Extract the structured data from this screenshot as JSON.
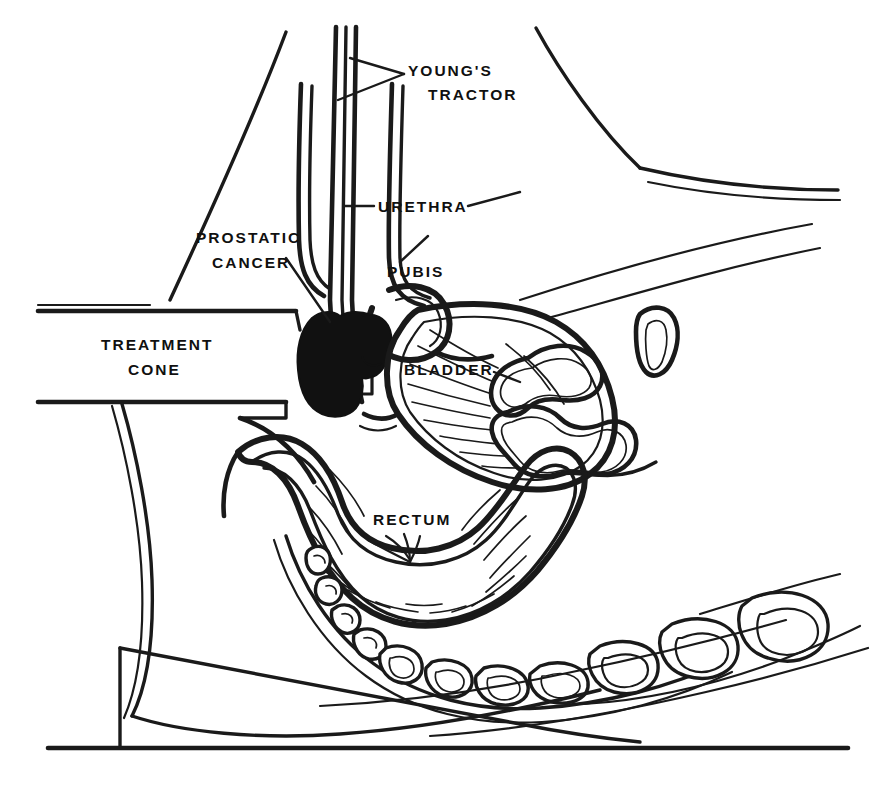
{
  "figure": {
    "kind": "anatomical-line-drawing",
    "orientation": "patient supine in lithotomy position, head to the right, perineum to the left",
    "background_color": "#ffffff",
    "ink_color": "#1a1a1a",
    "tumor_fill_color": "#111111"
  },
  "labels": [
    {
      "id": "youngs-tractor",
      "lines": [
        "YOUNG'S",
        "TRACTOR"
      ],
      "line1": "YOUNG'S",
      "line2": "TRACTOR",
      "x": 408,
      "y": 76,
      "align": "left",
      "points_to": "vertical double-line instrument shaft in the urethra"
    },
    {
      "id": "urethra",
      "lines": [
        "URETHRA"
      ],
      "line1": "URETHRA",
      "x": 378,
      "y": 212,
      "align": "left",
      "points_to": "urethral channel alongside the tractor shaft"
    },
    {
      "id": "pubis",
      "lines": [
        "PUBIS"
      ],
      "line1": "PUBIS",
      "x": 387,
      "y": 277,
      "align": "left",
      "points_to": "pubic symphysis bone profile"
    },
    {
      "id": "prostatic-cancer",
      "lines": [
        "PROSTATIC",
        "CANCER"
      ],
      "line1": "PROSTATIC",
      "line2": "CANCER",
      "x": 196,
      "y": 243,
      "align": "left",
      "points_to": "solid black prostatic tumour mass"
    },
    {
      "id": "treatment-cone",
      "lines": [
        "TREATMENT",
        "CONE"
      ],
      "line1": "TREATMENT",
      "line2": "CONE",
      "x": 101,
      "y": 350,
      "align": "left",
      "points_to": "horizontal perineal applicator channel"
    },
    {
      "id": "bladder",
      "lines": [
        "BLADDER"
      ],
      "line1": "BLADDER",
      "x": 404,
      "y": 375,
      "align": "left",
      "points_to": "urinary bladder lumen with mucosal folds"
    },
    {
      "id": "rectum",
      "lines": [
        "RECTUM"
      ],
      "line1": "RECTUM",
      "x": 373,
      "y": 525,
      "align": "left",
      "points_to": "rectal ampulla with radiating mucosal folds"
    }
  ],
  "structures": [
    {
      "id": "youngs-tractor",
      "name": "Young's tractor",
      "render": "double parallel vertical rods entering the urethra from above"
    },
    {
      "id": "urethra",
      "name": "Urethra",
      "render": "narrow channel paralleling the tractor shaft"
    },
    {
      "id": "pubis",
      "name": "Pubis",
      "render": "hook-shaped bone profile anterior to the bladder"
    },
    {
      "id": "prostatic-cancer",
      "name": "Prostatic cancer",
      "render": "solid filled black mass at the prostatic urethra"
    },
    {
      "id": "treatment-cone",
      "name": "Treatment cone",
      "render": "horizontal open-ended rectangular applicator from the left margin to the perineum"
    },
    {
      "id": "bladder",
      "name": "Bladder",
      "render": "double-outlined sac with radiating interior hatch lines"
    },
    {
      "id": "rectum",
      "name": "Rectum",
      "render": "double-outlined curved ampulla with radiating mucosal folds"
    },
    {
      "id": "bowel-loops",
      "name": "Small bowel loops",
      "render": "three free-floating double-outlined rounded loops right of the bladder"
    },
    {
      "id": "sacrum-coccyx",
      "name": "Sacrum and coccyx",
      "render": "curved chain of small rounded vertebral blocks behind the rectum"
    },
    {
      "id": "lumbar-vertebrae",
      "name": "Lumbar vertebrae",
      "render": "row of larger square vertebral bodies at lower right"
    },
    {
      "id": "abdominal-wall",
      "name": "Anterior abdominal wall",
      "render": "long diagonal contour lines at upper left and upper right"
    },
    {
      "id": "perineum-scrotum",
      "name": "Perineum and scrotal contour",
      "render": "S-curved double contour below the treatment cone"
    },
    {
      "id": "support-wedge",
      "name": "Support wedge / table",
      "render": "triangular wedge block on a horizontal table line at bottom"
    },
    {
      "id": "table-line",
      "name": "Table surface line",
      "render": "long horizontal baseline across the bottom of the figure"
    }
  ]
}
